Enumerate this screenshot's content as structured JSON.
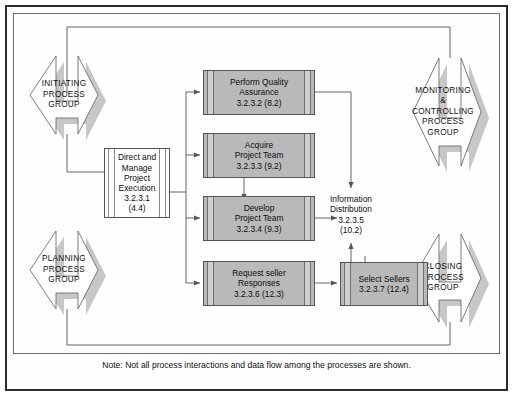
{
  "diagram": {
    "note": "Note: Not all process interactions and data flow among the processes are shown.",
    "colors": {
      "box_fill": "#b9b9b9",
      "box_band": "#cfcfcf",
      "box_stroke": "#555555",
      "chevron_shadow": "#c4c4c4",
      "chevron_stroke": "#6d6d6d",
      "frame_outer": "#2b2b2b",
      "frame_inner": "#6d6d6d",
      "line": "#555555",
      "page_bg": "#ffffff"
    }
  },
  "process_groups": [
    {
      "id": "initiating",
      "lines": [
        "INITIATING",
        "PROCESS",
        "GROUP"
      ]
    },
    {
      "id": "planning",
      "lines": [
        "PLANNING",
        "PROCESS",
        "GROUP"
      ]
    },
    {
      "id": "monitoring",
      "lines": [
        "MONITORING",
        "&",
        "CONTROLLING",
        "PROCESS",
        "GROUP"
      ]
    },
    {
      "id": "closing",
      "lines": [
        "CLOSING",
        "PROCESS",
        "GROUP"
      ]
    }
  ],
  "process_boxes": [
    {
      "id": "direct-manage",
      "style": "white",
      "lines": [
        "Direct and",
        "Manage",
        "Project",
        "Execution",
        "3.2.3.1",
        "(4.4)"
      ]
    },
    {
      "id": "perform-quality-assurance",
      "style": "gray",
      "lines": [
        "Perform Quality",
        "Assurance",
        "3.2.3.2 (8.2)"
      ]
    },
    {
      "id": "acquire-project-team",
      "style": "gray",
      "lines": [
        "Acquire",
        "Project Team",
        "3.2.3.3 (9.2)"
      ]
    },
    {
      "id": "develop-project-team",
      "style": "gray",
      "lines": [
        "Develop",
        "Project Team",
        "3.2.3.4 (9.3)"
      ]
    },
    {
      "id": "request-seller-responses",
      "style": "gray",
      "lines": [
        "Request seller",
        "Responses",
        "3.2.3.6 (12.3)"
      ]
    },
    {
      "id": "select-sellers",
      "style": "gray",
      "lines": [
        "Select Sellers",
        "3.2.3.7 (12.4)"
      ]
    }
  ],
  "text_nodes": [
    {
      "id": "information-distribution",
      "lines": [
        "Information",
        "Distribution",
        "3.2.3.5",
        "(10.2)"
      ]
    }
  ]
}
